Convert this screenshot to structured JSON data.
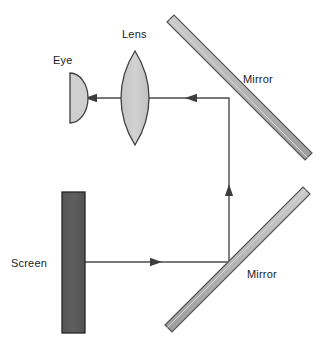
{
  "diagram": {
    "background_color": "#ffffff",
    "width": 321,
    "height": 354,
    "labels": {
      "eye": "Eye",
      "lens": "Lens",
      "mirror_top": "Mirror",
      "mirror_bottom": "Mirror",
      "screen": "Screen"
    },
    "colors": {
      "stroke": "#4a4a4a",
      "label": "#1a1a1a",
      "lens_fill": "#c9c9c9",
      "eye_fill": "#cfcfcf",
      "mirror_fill": "#b3b3b3",
      "mirror_edge": "#5a5a5a",
      "screen_fill": "#595959",
      "screen_edge": "#2b2b2b",
      "ray": "#4a4a4a"
    },
    "components": {
      "eye": {
        "name": "eye",
        "shape": "half-disc",
        "flat_edge": "left",
        "center_x": 70,
        "center_y": 98,
        "radius_x": 18,
        "radius_y": 25
      },
      "lens": {
        "name": "lens",
        "shape": "biconvex",
        "center_x": 135,
        "center_y": 98,
        "half_width": 14,
        "half_height": 47
      },
      "screen": {
        "name": "screen",
        "shape": "rectangle",
        "x": 62,
        "y": 192,
        "width": 23,
        "height": 141
      },
      "mirror_top": {
        "name": "mirror-top",
        "shape": "bar-45deg",
        "x1": 170,
        "y1": 25,
        "x2": 305,
        "y2": 163,
        "thickness": 10,
        "angle_degrees": 45
      },
      "mirror_bottom": {
        "name": "mirror-bottom",
        "shape": "bar-45deg",
        "x1": 167,
        "y1": 330,
        "x2": 304,
        "y2": 192,
        "thickness": 10,
        "angle_degrees": -45
      }
    },
    "rays": [
      {
        "name": "ray-screen-to-bottom-mirror",
        "direction": "right",
        "from_x": 85,
        "from_y": 262,
        "to_x": 229,
        "to_y": 262,
        "arrow_at_x": 157,
        "arrow_at_y": 262
      },
      {
        "name": "ray-bottom-mirror-to-top-mirror",
        "direction": "up",
        "from_x": 229,
        "from_y": 262,
        "to_x": 229,
        "to_y": 98,
        "arrow_at_x": 229,
        "arrow_at_y": 190
      },
      {
        "name": "ray-top-mirror-to-lens",
        "direction": "left",
        "from_x": 229,
        "from_y": 98,
        "to_x": 149,
        "to_y": 98,
        "arrow_at_x": 190,
        "arrow_at_y": 98
      },
      {
        "name": "ray-lens-to-eye",
        "direction": "left",
        "from_x": 149,
        "from_y": 98,
        "to_x": 86,
        "to_y": 98,
        "arrow_at_x": 90,
        "arrow_at_y": 98
      }
    ],
    "label_positions": {
      "eye": {
        "x": 53,
        "y": 64
      },
      "lens": {
        "x": 122,
        "y": 38
      },
      "mirror_top": {
        "x": 243,
        "y": 83
      },
      "mirror_bottom": {
        "x": 247,
        "y": 278
      },
      "screen": {
        "x": 11,
        "y": 267
      }
    }
  }
}
